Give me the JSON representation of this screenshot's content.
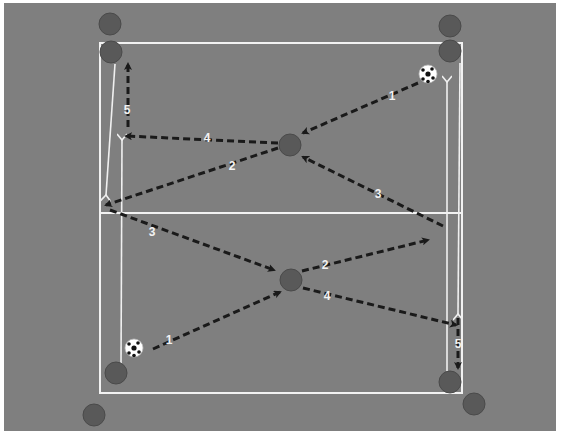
{
  "diagram": {
    "type": "soccer-drill",
    "colors": {
      "field": "#7f7f7f",
      "field_border": "#f4f4f4",
      "lines": "#f2f2f2",
      "player": "#595959",
      "player_outline": "#4a4a4a",
      "pass_arrow": "#1a1a1a",
      "run_arrow": "#f0f0f0",
      "ball_white": "#ffffff",
      "ball_black": "#111111"
    },
    "field": {
      "x": 4,
      "y": 3,
      "width": 552,
      "height": 428
    },
    "zones": {
      "outer_rect": {
        "x": 100,
        "y": 43,
        "width": 362,
        "height": 350
      },
      "midline_y": 213
    },
    "players": [
      {
        "id": "top-left-outside",
        "cx": 110,
        "cy": 24
      },
      {
        "id": "top-left-corner",
        "cx": 111,
        "cy": 52
      },
      {
        "id": "top-right-outside",
        "cx": 450,
        "cy": 26
      },
      {
        "id": "top-right-corner",
        "cx": 450,
        "cy": 51
      },
      {
        "id": "center-top",
        "cx": 290,
        "cy": 145
      },
      {
        "id": "center-bottom",
        "cx": 291,
        "cy": 280
      },
      {
        "id": "bottom-left-corner",
        "cx": 116,
        "cy": 373
      },
      {
        "id": "bottom-left-outside",
        "cx": 94,
        "cy": 415
      },
      {
        "id": "bottom-right-corner",
        "cx": 450,
        "cy": 382
      },
      {
        "id": "bottom-right-outside",
        "cx": 474,
        "cy": 404
      }
    ],
    "balls": [
      {
        "id": "ball-top-right",
        "cx": 428,
        "cy": 74
      },
      {
        "id": "ball-bottom-left",
        "cx": 134,
        "cy": 348
      }
    ],
    "passes": [
      {
        "label": "1",
        "half": "top",
        "x1": 418,
        "y1": 83,
        "x2": 303,
        "y2": 133,
        "lx": 392,
        "ly": 97
      },
      {
        "label": "2",
        "half": "top",
        "x1": 278,
        "y1": 148,
        "x2": 106,
        "y2": 205,
        "lx": 232,
        "ly": 167
      },
      {
        "label": "3",
        "half": "top",
        "x1": 443,
        "y1": 226,
        "x2": 303,
        "y2": 157,
        "lx": 378,
        "ly": 195
      },
      {
        "label": "4",
        "half": "top",
        "x1": 278,
        "y1": 143,
        "x2": 126,
        "y2": 136,
        "lx": 207,
        "ly": 139
      },
      {
        "label": "5",
        "half": "top",
        "x1": 128,
        "y1": 127,
        "x2": 128,
        "y2": 64,
        "lx": 127,
        "ly": 111
      },
      {
        "label": "1",
        "half": "bottom",
        "x1": 153,
        "y1": 349,
        "x2": 280,
        "y2": 292,
        "lx": 169,
        "ly": 341
      },
      {
        "label": "2",
        "half": "bottom",
        "x1": 302,
        "y1": 271,
        "x2": 428,
        "y2": 240,
        "lx": 325,
        "ly": 266
      },
      {
        "label": "3",
        "half": "bottom",
        "x1": 110,
        "y1": 210,
        "x2": 274,
        "y2": 270,
        "lx": 152,
        "ly": 233
      },
      {
        "label": "4",
        "half": "bottom",
        "x1": 303,
        "y1": 288,
        "x2": 456,
        "y2": 325,
        "lx": 327,
        "ly": 297
      },
      {
        "label": "5",
        "half": "bottom",
        "x1": 458,
        "y1": 318,
        "x2": 458,
        "y2": 368,
        "lx": 458,
        "ly": 345
      }
    ],
    "runs": [
      {
        "id": "run-top-left-down",
        "x1": 115,
        "y1": 64,
        "x2": 106,
        "y2": 195
      },
      {
        "id": "run-top-left-up",
        "x1": 121,
        "y1": 366,
        "x2": 122,
        "y2": 140
      },
      {
        "id": "run-right-up",
        "x1": 447,
        "y1": 375,
        "x2": 447,
        "y2": 82
      },
      {
        "id": "run-right-down",
        "x1": 460,
        "y1": 63,
        "x2": 458,
        "y2": 314
      }
    ]
  }
}
